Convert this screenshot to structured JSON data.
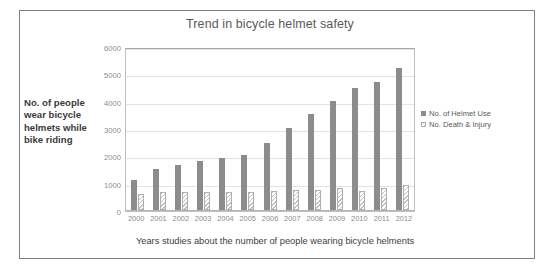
{
  "chart_data": {
    "type": "bar",
    "title": "Trend in bicycle helmet safety",
    "xlabel": "Years studies about the number of people wearing bicycle helments",
    "ylabel": "No. of people wear bicycle helmets while bike riding",
    "categories": [
      "2000",
      "2001",
      "2002",
      "2003",
      "2004",
      "2005",
      "2006",
      "2007",
      "2008",
      "2009",
      "2010",
      "2011",
      "2012"
    ],
    "series": [
      {
        "name": "No. of Helmet Use",
        "color": "#8c8c8c",
        "values": [
          1100,
          1500,
          1650,
          1800,
          1900,
          2000,
          2450,
          3000,
          3500,
          4000,
          4450,
          4700,
          5200
        ]
      },
      {
        "name": "No. Death & Injury",
        "color": "#bfbfbf",
        "values": [
          600,
          650,
          650,
          650,
          650,
          650,
          700,
          750,
          750,
          800,
          700,
          800,
          900
        ]
      }
    ],
    "ylim": [
      0,
      6000
    ],
    "yticks": [
      "0",
      "1000",
      "2000",
      "3000",
      "4000",
      "5000",
      "6000"
    ],
    "ytick_values": [
      0,
      1000,
      2000,
      3000,
      4000,
      5000,
      6000
    ],
    "grid": true,
    "legend_position": "right"
  },
  "legend": {
    "entries": [
      {
        "label": "No. of Helmet Use"
      },
      {
        "label": "No. Death & Injury"
      }
    ]
  }
}
